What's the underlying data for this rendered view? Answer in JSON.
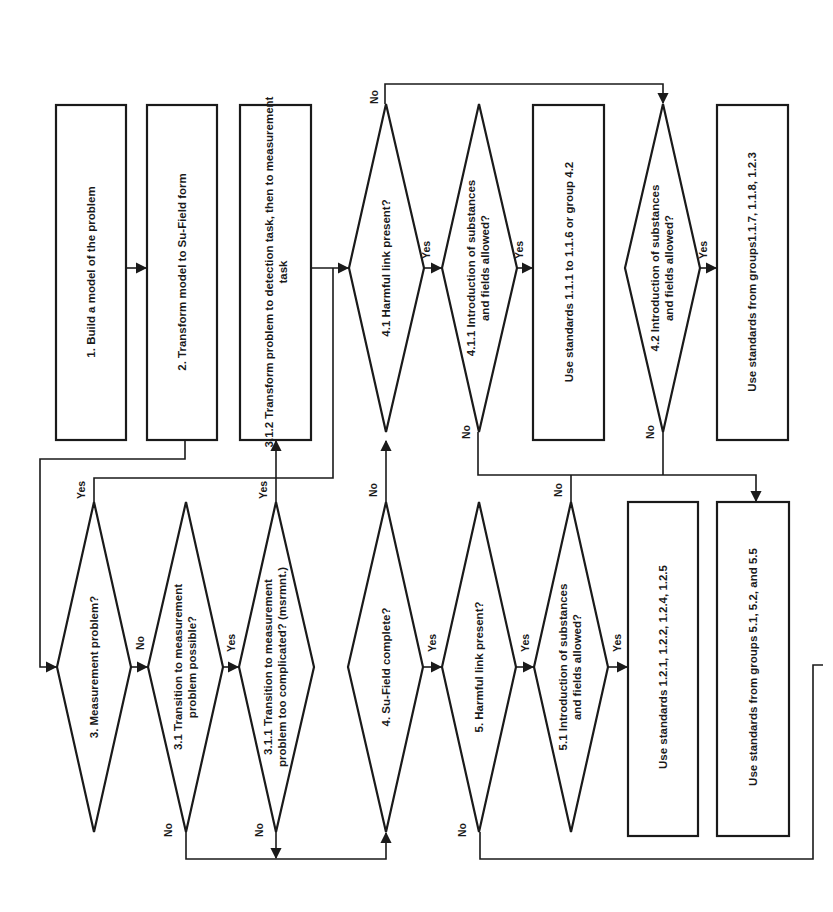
{
  "diagram": {
    "orientation": "rotated 90 degrees counter-clockwise",
    "nodes": {
      "n1": {
        "label": "1. Build a model of the problem",
        "type": "process"
      },
      "n2": {
        "label": "2. Transform model to Su-Field form",
        "type": "process"
      },
      "n312": {
        "line1": "3.1.2 Transform problem to detection task, then to measurement",
        "line2": "task",
        "type": "process"
      },
      "n41": {
        "label": "4.1 Harmful link present?",
        "type": "decision"
      },
      "n411": {
        "line1": "4.1.1 Introduction of substances",
        "line2": "and fields allowed?",
        "type": "decision"
      },
      "b111": {
        "label": "Use standards 1.1.1 to 1.1.6 or group 4.2",
        "type": "process"
      },
      "n42": {
        "line1": "4.2 Introduction of substances",
        "line2": "and fields allowed?",
        "type": "decision"
      },
      "b117": {
        "label": "Use standards from groups1.1.7, 1.1.8, 1.2.3",
        "type": "process"
      },
      "n3": {
        "label": "3. Measurement problem?",
        "type": "decision"
      },
      "n31": {
        "line1": "3.1 Transition to measurement",
        "line2": "problem possible?",
        "type": "decision"
      },
      "n311": {
        "line1": "3.1.1 Transition to measurement",
        "line2": "problem too complicated? (msrmnt.)",
        "type": "decision"
      },
      "n4": {
        "label": "4. Su-Field complete?",
        "type": "decision"
      },
      "n5": {
        "label": "5. Harmful link present?",
        "type": "decision"
      },
      "n51": {
        "line1": "5.1 Introduction of substances",
        "line2": "and fields allowed?",
        "type": "decision"
      },
      "b121": {
        "label": "Use standards 1.2.1, 1.2.2, 1.2.4, 1.2.5",
        "type": "process"
      },
      "b51": {
        "label": "Use standards from groups 5.1, 5.2, and 5.5",
        "type": "process"
      }
    },
    "edge_labels": {
      "yes": "Yes",
      "no": "No"
    },
    "colors": {
      "stroke": "#1a1a1a",
      "background": "#ffffff"
    }
  }
}
